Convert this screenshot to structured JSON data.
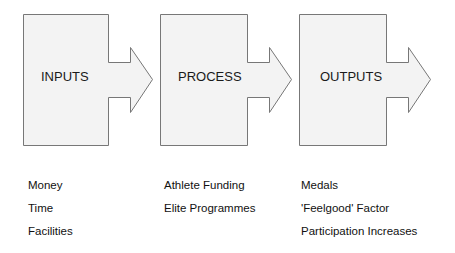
{
  "diagram": {
    "type": "process-flow",
    "colors": {
      "box_fill": "#f3f3f3",
      "box_stroke": "#777777",
      "text": "#111111"
    },
    "stages": [
      {
        "id": "inputs",
        "label": "INPUTS",
        "items": [
          "Money",
          "Time",
          "Facilities"
        ]
      },
      {
        "id": "process",
        "label": "PROCESS",
        "items": [
          "Athlete Funding",
          "Elite Programmes"
        ]
      },
      {
        "id": "outputs",
        "label": "OUTPUTS",
        "items": [
          "Medals",
          "'Feelgood' Factor",
          "Participation Increases"
        ]
      }
    ]
  }
}
